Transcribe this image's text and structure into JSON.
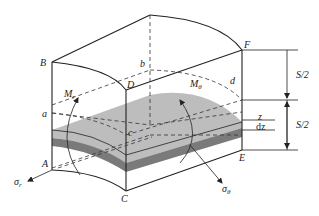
{
  "figure": {
    "type": "shell-element-stress-diagram",
    "colors": {
      "background": "#ffffff",
      "line": "#222222",
      "layer_top": "#bdbdbd",
      "layer_side": "#7a7a7a"
    },
    "labels": {
      "B": "B",
      "D": "D",
      "b": "b",
      "F": "F",
      "d": "d",
      "a": "a",
      "c": "c",
      "A": "A",
      "C": "C",
      "E": "E",
      "Mr": "M",
      "Mr_sub": "r",
      "Mtheta": "M",
      "Mtheta_sub": "θ",
      "sigma_r": "σ",
      "sigma_r_sub": "r",
      "sigma_theta": "σ",
      "sigma_theta_sub": "θ",
      "z": "z",
      "dz": "dz",
      "half_thickness_top": "S/2",
      "half_thickness_bottom": "S/2"
    }
  }
}
